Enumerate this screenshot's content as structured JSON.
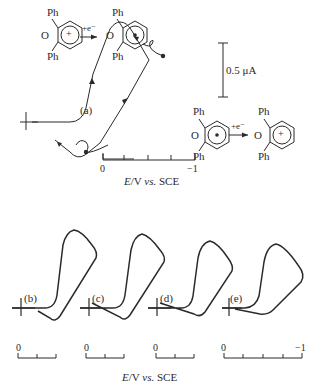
{
  "figure": {
    "top_panel": {
      "label": "(a)",
      "scale_bar": "0.5 μA",
      "reaction_top": {
        "reactant_substituent_top": "Ph",
        "reactant_substituent_bottom": "Ph",
        "reactant_heteroatom": "O",
        "reactant_charge": "+",
        "arrow_label": "+e⁻",
        "product_substituent_top": "Ph",
        "product_substituent_bottom": "Ph",
        "product_heteroatom": "O",
        "product_mark": "•"
      },
      "reaction_bottom": {
        "reactant_substituent_top": "Ph",
        "reactant_substituent_bottom": "Ph",
        "reactant_heteroatom": "O",
        "reactant_mark": "•",
        "arrow_label": "+e⁻",
        "product_substituent_top": "Ph",
        "product_substituent_bottom": "Ph",
        "product_heteroatom": "O",
        "product_charge": "+"
      },
      "axis": {
        "start": "0",
        "end": "−1",
        "title_italic": "E",
        "title_rest": "/V ",
        "title_vs": "vs.",
        "title_ref": " SCE"
      }
    },
    "bottom_panels": [
      {
        "label": "(b)",
        "axis_start": "0"
      },
      {
        "label": "(c)",
        "axis_start": "0"
      },
      {
        "label": "(d)",
        "axis_start": "0"
      },
      {
        "label": "(e)",
        "axis_start": "0",
        "axis_end": "−1"
      }
    ],
    "bottom_axis_title": {
      "italic": "E",
      "rest": "/V ",
      "vs": "vs.",
      "ref": " SCE"
    }
  }
}
